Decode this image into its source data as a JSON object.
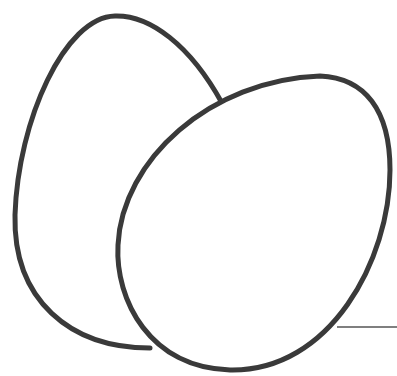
{
  "illustration": {
    "subject": "two eggs line drawing",
    "stroke_color": "#3a3a3a",
    "background": "#ffffff",
    "back_egg": {
      "path": "M 222 103 C 190 45, 150 15, 115 16 C 65 17, 18 120, 15 215 C 13 300, 70 348, 150 348"
    },
    "front_egg": {
      "path": "M 320 76 C 365 78, 390 110, 390 170 C 390 260, 330 372, 230 370 C 150 368, 115 300, 118 245 C 122 160, 210 80, 320 76 Z"
    },
    "ground_line": {
      "x1": 337,
      "y1": 327,
      "x2": 397,
      "y2": 327
    }
  }
}
